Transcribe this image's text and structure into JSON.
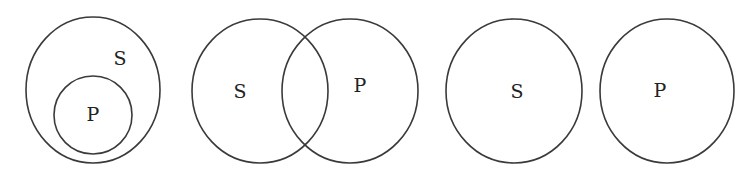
{
  "diagrams": [
    {
      "name": "subset",
      "circles": [
        {
          "label": "S",
          "cx": 93,
          "cy": 90,
          "rx": 67,
          "ry": 73,
          "label_x": 120,
          "label_y": 58
        },
        {
          "label": "P",
          "cx": 93,
          "cy": 115,
          "rx": 39,
          "ry": 39,
          "label_x": 93,
          "label_y": 114
        }
      ]
    },
    {
      "name": "overlap",
      "circles": [
        {
          "label": "S",
          "cx": 260,
          "cy": 91,
          "rx": 68,
          "ry": 72,
          "label_x": 240,
          "label_y": 91
        },
        {
          "label": "P",
          "cx": 350,
          "cy": 91,
          "rx": 68,
          "ry": 72,
          "label_x": 360,
          "label_y": 85
        }
      ]
    },
    {
      "name": "disjoint",
      "circles": [
        {
          "label": "S",
          "cx": 514,
          "cy": 91,
          "rx": 68,
          "ry": 72,
          "label_x": 517,
          "label_y": 91
        },
        {
          "label": "P",
          "cx": 667,
          "cy": 91,
          "rx": 67,
          "ry": 72,
          "label_x": 660,
          "label_y": 90
        }
      ]
    }
  ],
  "colors": {
    "stroke": "#3a3a3a",
    "text": "#222222",
    "background": "#ffffff"
  }
}
